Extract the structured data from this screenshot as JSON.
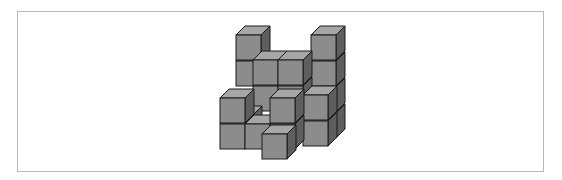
{
  "figure": {
    "colors": {
      "front": "#8c8c8c",
      "top": "#a6a6a6",
      "side": "#5e5e5e",
      "edge": "#1a1a1a",
      "border": "#b8b8b8"
    },
    "cube": {
      "size": 25,
      "dx": 9,
      "dy": 9
    },
    "cubes": [
      {
        "x": 236,
        "y": 61
      },
      {
        "x": 236,
        "y": 35
      },
      {
        "x": 311,
        "y": 113
      },
      {
        "x": 311,
        "y": 87
      },
      {
        "x": 311,
        "y": 61
      },
      {
        "x": 311,
        "y": 35
      },
      {
        "x": 253,
        "y": 86
      },
      {
        "x": 278,
        "y": 86
      },
      {
        "x": 228,
        "y": 115
      },
      {
        "x": 253,
        "y": 60
      },
      {
        "x": 278,
        "y": 60
      },
      {
        "x": 303,
        "y": 121
      },
      {
        "x": 303,
        "y": 95
      },
      {
        "x": 220,
        "y": 124
      },
      {
        "x": 220,
        "y": 98
      },
      {
        "x": 245,
        "y": 124
      },
      {
        "x": 270,
        "y": 124
      },
      {
        "x": 270,
        "y": 98
      },
      {
        "x": 262,
        "y": 134
      }
    ]
  }
}
